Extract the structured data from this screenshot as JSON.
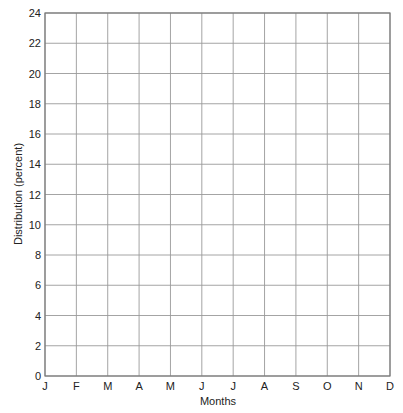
{
  "chart_data": {
    "type": "line",
    "title": "",
    "xlabel": "Months",
    "ylabel": "Distribution (percent)",
    "categories": [
      "J",
      "F",
      "M",
      "A",
      "M",
      "J",
      "J",
      "A",
      "S",
      "O",
      "N",
      "D"
    ],
    "series": [],
    "ylim": [
      0,
      24
    ],
    "yticks": [
      0,
      2,
      4,
      6,
      8,
      10,
      12,
      14,
      16,
      18,
      20,
      22,
      24
    ],
    "grid": true,
    "legend": null,
    "note": "Blank grid — no data plotted"
  },
  "colors": {
    "grid": "#9a9a9a",
    "frame": "#7a7a7a",
    "text": "#222222"
  }
}
